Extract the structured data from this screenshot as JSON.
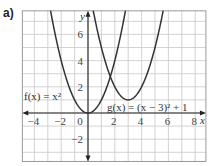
{
  "part_label": "a)",
  "chart_data": {
    "type": "line",
    "title": "",
    "xlabel": "x",
    "ylabel": "y",
    "xlim": [
      -4.9,
      8.8
    ],
    "ylim": [
      -3.7,
      7.8
    ],
    "grid": true,
    "x_ticks": [
      -4,
      -2,
      0,
      2,
      4,
      6,
      8
    ],
    "y_ticks": [
      -2,
      2,
      4,
      6
    ],
    "series": [
      {
        "name": "f(x) = x^2",
        "label_text": "f(x) = x²",
        "expression": "x^2",
        "vertex": [
          0,
          0
        ],
        "color": "#333333"
      },
      {
        "name": "g(x) = (x − 3)^2 + 1",
        "label_text": "g(x) = (x − 3)² + 1",
        "expression": "(x-3)^2+1",
        "vertex": [
          3,
          1
        ],
        "color": "#333333"
      }
    ]
  },
  "colors": {
    "grid": "#c8c8c8",
    "frame": "#999999",
    "axis": "#222222",
    "curve": "#333333"
  }
}
